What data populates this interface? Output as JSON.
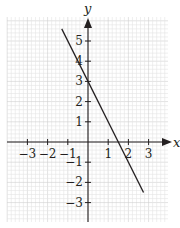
{
  "chart_data": {
    "type": "line",
    "title": "",
    "xlabel": "x",
    "ylabel": "y",
    "xlim": [
      -4,
      4
    ],
    "ylim": [
      -4,
      6
    ],
    "grid": true,
    "minor_divisions_per_unit": 5,
    "x_ticks": [
      -3,
      -2,
      -1,
      1,
      2,
      3
    ],
    "y_ticks": [
      -3,
      -2,
      -1,
      1,
      2,
      3,
      4,
      5
    ],
    "x_tick_labels": [
      "−3",
      "−2",
      "−1",
      "1",
      "2",
      "3"
    ],
    "y_tick_labels": [
      "−3",
      "−2",
      "−1",
      "1",
      "2",
      "3",
      "4",
      "5"
    ],
    "series": [
      {
        "name": "y = -2x + 3",
        "equation": "y = -2x + 3",
        "x": [
          -1.3,
          2.75
        ],
        "y": [
          5.6,
          -2.5
        ],
        "color": "#231f20"
      }
    ],
    "legend": null
  },
  "colors": {
    "grid_minor": "#e4e4e4",
    "grid_major": "#cfcfcf",
    "axis": "#231f20",
    "line": "#231f20"
  }
}
